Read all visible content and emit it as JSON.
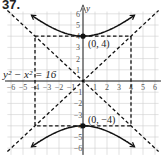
{
  "problem": {
    "number": "37."
  },
  "chart_data": {
    "type": "line",
    "title": "",
    "equation_label": "y² − x² = 16",
    "xlabel": "x",
    "ylabel": "y",
    "xlim": [
      -6,
      6
    ],
    "ylim": [
      -6,
      6
    ],
    "grid": true,
    "x_ticks": [
      "-6",
      "-5",
      "-4",
      "-3",
      "-2",
      "-1",
      "1",
      "2",
      "3",
      "4",
      "5",
      "6"
    ],
    "y_ticks": [
      "6",
      "5",
      "4",
      "3",
      "2",
      "1",
      "-1",
      "-2",
      "-3",
      "-4",
      "-5",
      "-6"
    ],
    "series": [
      {
        "name": "upper branch",
        "style": "solid",
        "equation": "y = sqrt(16 + x^2)",
        "x_range": [
          -4.3,
          4.3
        ]
      },
      {
        "name": "lower branch",
        "style": "solid",
        "equation": "y = -sqrt(16 + x^2)",
        "x_range": [
          -4.3,
          4.3
        ]
      },
      {
        "name": "asymptote y = x",
        "style": "dashed"
      },
      {
        "name": "asymptote y = -x",
        "style": "dashed"
      },
      {
        "name": "fundamental rectangle",
        "style": "dashed",
        "corners": [
          [
            -4,
            4
          ],
          [
            4,
            4
          ],
          [
            4,
            -4
          ],
          [
            -4,
            -4
          ]
        ]
      }
    ],
    "points": [
      {
        "label": "(0, 4)",
        "x": 0,
        "y": 4
      },
      {
        "label": "(0, −4)",
        "x": 0,
        "y": -4
      }
    ],
    "colors": {
      "curve": "#111111",
      "grid": "#cfcfcf",
      "axis": "#222222"
    }
  }
}
